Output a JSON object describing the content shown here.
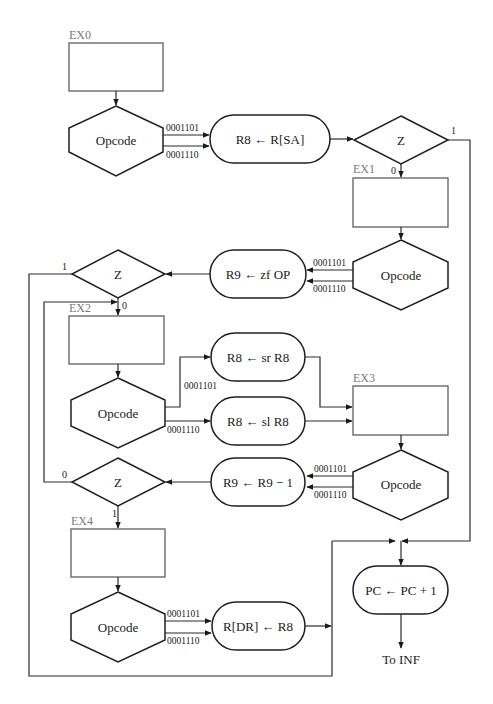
{
  "diagram": {
    "type": "flowchart",
    "states": {
      "ex0": "EX0",
      "ex1": "EX1",
      "ex2": "EX2",
      "ex3": "EX3",
      "ex4": "EX4"
    },
    "decisions": {
      "opcode_label": "Opcode",
      "z_label": "Z"
    },
    "operations": {
      "r8_load": "R8 ← R[SA]",
      "r9_zf": "R9 ← zf OP",
      "r8_sr": "R8 ← sr R8",
      "r8_sl": "R8 ← sl R8",
      "r9_dec": "R9 ← R9 − 1",
      "rdr_store": "R[DR] ← R8",
      "pc_inc": "PC ← PC + 1"
    },
    "opcodes": {
      "a": "0001101",
      "b": "0001110"
    },
    "branch_labels": {
      "one": "1",
      "zero": "0"
    },
    "terminal": "To INF"
  }
}
